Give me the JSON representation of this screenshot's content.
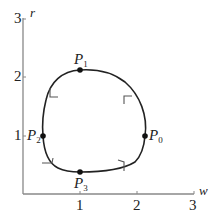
{
  "diagram": {
    "axes": {
      "x_label": "w",
      "y_label": "r",
      "x_ticks": [
        "1",
        "2",
        "3"
      ],
      "y_ticks": [
        "1",
        "2",
        "3"
      ]
    },
    "points": [
      {
        "name": "P",
        "sub": "0",
        "w": 2.1,
        "r": 1.0
      },
      {
        "name": "P",
        "sub": "1",
        "w": 1.0,
        "r": 2.15
      },
      {
        "name": "P",
        "sub": "2",
        "w": 0.35,
        "r": 1.0
      },
      {
        "name": "P",
        "sub": "3",
        "w": 1.0,
        "r": 0.4
      }
    ],
    "curve": "closed loop through P0, P1, P2, P3 with arrow markers (counterclockwise)",
    "colors": {
      "axis": "#888888",
      "curve": "#222222",
      "point": "#111111"
    }
  }
}
